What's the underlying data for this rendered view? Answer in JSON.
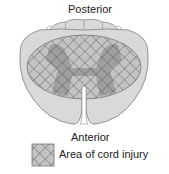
{
  "diagram": {
    "labels": {
      "top": "Posterior",
      "bottom": "Anterior"
    },
    "legend": [
      {
        "pattern": "crosshatch",
        "label": "Area of cord injury"
      }
    ],
    "colors": {
      "cord_fill": "#d9d9d9",
      "cord_outline": "#8a8a8a",
      "injury_fill": "#b8b8b8",
      "grey_matter": "#9a9a9a",
      "hatch_line": "#555555"
    }
  }
}
